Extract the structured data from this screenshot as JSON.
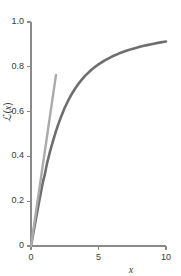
{
  "chart_data": {
    "type": "line",
    "title": "",
    "xlabel": "x",
    "ylabel": "ℒ(x)",
    "ylabel_parts": {
      "symbol": "ℒ",
      "open": "(",
      "variable": "x",
      "close": ")"
    },
    "xlim": [
      0,
      10
    ],
    "ylim": [
      0,
      1.0
    ],
    "xticks": [
      0,
      5,
      10
    ],
    "xtick_labels": [
      "0",
      "5",
      "10"
    ],
    "yticks": [
      0,
      0.2,
      0.4,
      0.6,
      0.8,
      1.0
    ],
    "ytick_labels": [
      "0",
      "0.2",
      "0.4",
      "0.6",
      "0.8",
      "1.0"
    ],
    "grid": false,
    "legend": null,
    "series": [
      {
        "name": "Langevin function",
        "color": "#6e6e6e",
        "width": 2.6,
        "x": [
          0,
          0.1,
          0.2,
          0.3,
          0.4,
          0.5,
          0.6,
          0.7,
          0.8,
          0.9,
          1.0,
          1.2,
          1.4,
          1.6,
          1.8,
          2.0,
          2.25,
          2.5,
          2.75,
          3.0,
          3.25,
          3.5,
          3.75,
          4.0,
          4.5,
          5.0,
          5.5,
          6.0,
          6.5,
          7.0,
          7.5,
          8.0,
          8.5,
          9.0,
          9.5,
          10.0
        ],
        "y": [
          0,
          0.0333,
          0.0666,
          0.0997,
          0.1325,
          0.1651,
          0.1973,
          0.2289,
          0.2601,
          0.2905,
          0.313,
          0.3723,
          0.4194,
          0.463,
          0.5033,
          0.5398,
          0.5808,
          0.6169,
          0.6486,
          0.6765,
          0.7011,
          0.7228,
          0.7421,
          0.7593,
          0.788,
          0.8111,
          0.83,
          0.8457,
          0.859,
          0.8703,
          0.88,
          0.8884,
          0.8957,
          0.9022,
          0.9079,
          0.913
        ]
      },
      {
        "name": "Initial tangent (slope 1/3)",
        "color": "#ababab",
        "width": 2.4,
        "x": [
          0,
          1.85
        ],
        "y": [
          0,
          0.7633
        ]
      }
    ]
  },
  "axes": {
    "x_axis_name": "x-axis",
    "y_axis_name": "y-axis",
    "spine_color": "#8a8a8a",
    "tick_color": "#8a8a8a"
  }
}
